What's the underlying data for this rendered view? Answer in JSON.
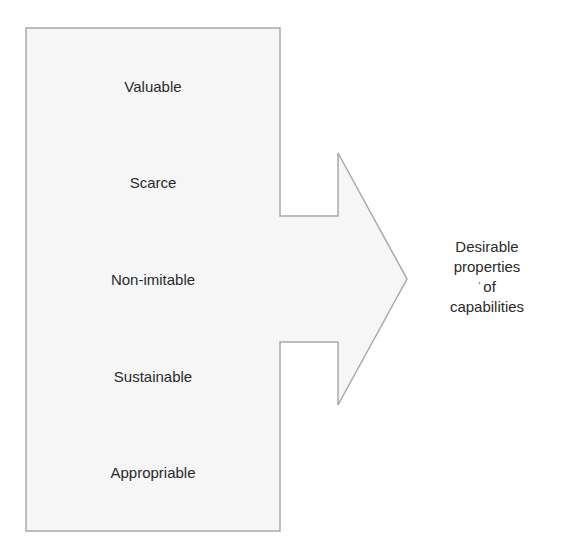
{
  "diagram": {
    "properties": [
      {
        "label": "Valuable",
        "y": 87
      },
      {
        "label": "Scarce",
        "y": 183
      },
      {
        "label": "Non-imitable",
        "y": 280
      },
      {
        "label": "Sustainable",
        "y": 377
      },
      {
        "label": "Appropriable",
        "y": 473
      }
    ],
    "outcome": {
      "lines": [
        "Desirable",
        "properties",
        "of",
        "capabilities"
      ],
      "stray_mark": "’"
    },
    "colors": {
      "fill": "#f6f6f6",
      "stroke": "#a9a9a9",
      "text": "#2a2a2a"
    }
  }
}
